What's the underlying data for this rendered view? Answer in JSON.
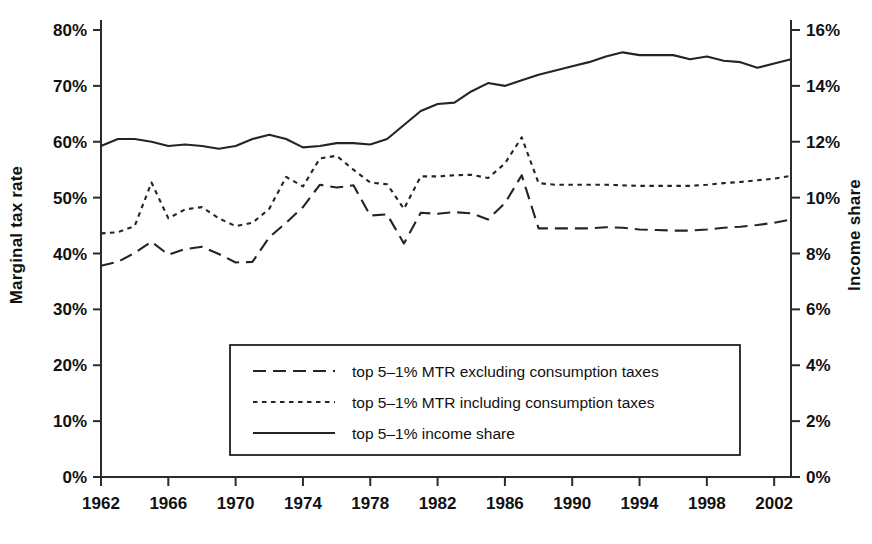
{
  "axes": {
    "left_title": "Marginal tax rate",
    "right_title": "Income share",
    "left_ticks": [
      "0%",
      "10%",
      "20%",
      "30%",
      "40%",
      "50%",
      "60%",
      "70%",
      "80%"
    ],
    "right_ticks": [
      "0%",
      "2%",
      "4%",
      "6%",
      "8%",
      "10%",
      "12%",
      "14%",
      "16%"
    ],
    "x_ticks": [
      "1962",
      "1966",
      "1970",
      "1974",
      "1978",
      "1982",
      "1986",
      "1990",
      "1994",
      "1998",
      "2002"
    ]
  },
  "legend": {
    "items": [
      {
        "label": "top 5–1% MTR excluding consumption taxes",
        "style": "long-dash"
      },
      {
        "label": "top 5–1% MTR including consumption taxes",
        "style": "short-dash"
      },
      {
        "label": "top 5–1% income share",
        "style": "solid"
      }
    ]
  },
  "colors": {
    "ink": "#242424",
    "background": "#ffffff"
  },
  "chart_data": {
    "type": "line",
    "title": "",
    "xlabel": "",
    "ylabel": "Marginal tax rate",
    "y2label": "Income share",
    "xlim": [
      1962,
      2003
    ],
    "ylim": [
      0,
      80
    ],
    "y2lim": [
      0,
      16
    ],
    "grid": false,
    "legend_position": "lower-center",
    "x": [
      1962,
      1963,
      1964,
      1965,
      1966,
      1967,
      1968,
      1969,
      1970,
      1971,
      1972,
      1973,
      1974,
      1975,
      1976,
      1977,
      1978,
      1979,
      1980,
      1981,
      1982,
      1983,
      1984,
      1985,
      1986,
      1987,
      1988,
      1989,
      1990,
      1991,
      1992,
      1993,
      1994,
      1995,
      1996,
      1997,
      1998,
      1999,
      2000,
      2001,
      2002,
      2003
    ],
    "series": [
      {
        "name": "top 5–1% MTR excluding consumption taxes",
        "axis": "left",
        "style": "long-dash",
        "unit": "%",
        "values": [
          37.8,
          38.5,
          40.1,
          42.1,
          39.8,
          40.8,
          41.2,
          39.9,
          38.4,
          38.5,
          42.9,
          45.5,
          48.3,
          52.3,
          51.8,
          52.2,
          46.8,
          47.0,
          41.8,
          47.3,
          47.1,
          47.4,
          47.2,
          46.1,
          49.0,
          54.0,
          44.5,
          44.5,
          44.5,
          44.5,
          44.7,
          44.6,
          44.3,
          44.2,
          44.1,
          44.1,
          44.3,
          44.6,
          44.8,
          45.1,
          45.5,
          46.1
        ]
      },
      {
        "name": "top 5–1% MTR including consumption taxes",
        "axis": "left",
        "style": "short-dash",
        "unit": "%",
        "values": [
          43.6,
          43.8,
          44.9,
          52.7,
          46.3,
          47.9,
          48.3,
          46.3,
          44.9,
          45.5,
          48.0,
          53.7,
          52.0,
          57.0,
          57.5,
          55.0,
          52.7,
          52.4,
          48.0,
          53.8,
          53.8,
          54.0,
          54.1,
          53.5,
          56.1,
          60.8,
          52.6,
          52.3,
          52.3,
          52.3,
          52.3,
          52.2,
          52.1,
          52.1,
          52.1,
          52.1,
          52.3,
          52.6,
          52.8,
          53.1,
          53.4,
          53.9
        ]
      },
      {
        "name": "top 5–1% income share",
        "axis": "right",
        "style": "solid",
        "unit": "%",
        "values": [
          11.85,
          12.1,
          12.1,
          12.0,
          11.85,
          11.9,
          11.85,
          11.75,
          11.85,
          12.1,
          12.25,
          12.1,
          11.8,
          11.85,
          11.95,
          11.95,
          11.9,
          12.1,
          12.6,
          13.1,
          13.35,
          13.4,
          13.8,
          14.1,
          14.0,
          14.2,
          14.4,
          14.55,
          14.7,
          14.85,
          15.05,
          15.2,
          15.1,
          15.1,
          15.1,
          14.95,
          15.05,
          14.9,
          14.85,
          14.65,
          14.8,
          14.95
        ]
      }
    ]
  }
}
